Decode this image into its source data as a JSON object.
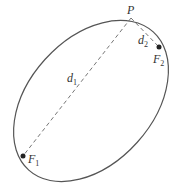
{
  "diagram": {
    "type": "ellipse-foci",
    "colors": {
      "curve": "#555555",
      "dash": "#666666",
      "point": "#222222"
    },
    "ellipse": {
      "cx": 91,
      "cy": 101,
      "rx": 92,
      "ry": 63,
      "rotation": -48
    },
    "points": {
      "P": {
        "label": "P",
        "x": 131,
        "y": 18
      },
      "F1": {
        "label": "F",
        "sub": "1",
        "x": 23,
        "y": 156
      },
      "F2": {
        "label": "F",
        "sub": "2",
        "x": 159,
        "y": 47
      }
    },
    "segments": {
      "d1": {
        "label": "d",
        "sub": "1"
      },
      "d2": {
        "label": "d",
        "sub": "2"
      }
    }
  }
}
